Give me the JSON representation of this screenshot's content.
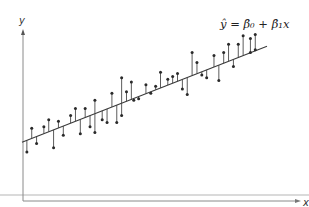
{
  "chart_data": {
    "type": "scatter",
    "title": "",
    "xlabel": "x",
    "ylabel": "y",
    "annotation": "ŷ = β̂₀ + β̂₁x",
    "grid": false,
    "legend": null,
    "xlim": [
      0,
      100
    ],
    "ylim": [
      0,
      100
    ],
    "regression_line": {
      "intercept": 22,
      "slope": 0.68,
      "x_start": 0,
      "x_end": 100
    },
    "points": [
      {
        "x": 2,
        "y": 15
      },
      {
        "x": 4,
        "y": 32
      },
      {
        "x": 6,
        "y": 21
      },
      {
        "x": 9,
        "y": 33
      },
      {
        "x": 11,
        "y": 38
      },
      {
        "x": 13,
        "y": 18
      },
      {
        "x": 15,
        "y": 37
      },
      {
        "x": 17,
        "y": 27
      },
      {
        "x": 20,
        "y": 41
      },
      {
        "x": 22,
        "y": 46
      },
      {
        "x": 24,
        "y": 28
      },
      {
        "x": 26,
        "y": 46
      },
      {
        "x": 28,
        "y": 33
      },
      {
        "x": 30,
        "y": 52
      },
      {
        "x": 30,
        "y": 29
      },
      {
        "x": 33,
        "y": 38
      },
      {
        "x": 35,
        "y": 36
      },
      {
        "x": 37,
        "y": 57
      },
      {
        "x": 39,
        "y": 36
      },
      {
        "x": 41,
        "y": 41
      },
      {
        "x": 41,
        "y": 68
      },
      {
        "x": 43,
        "y": 58
      },
      {
        "x": 45,
        "y": 65
      },
      {
        "x": 46,
        "y": 52
      },
      {
        "x": 48,
        "y": 53
      },
      {
        "x": 51,
        "y": 63
      },
      {
        "x": 53,
        "y": 57
      },
      {
        "x": 55,
        "y": 62
      },
      {
        "x": 57,
        "y": 72
      },
      {
        "x": 60,
        "y": 67
      },
      {
        "x": 62,
        "y": 69
      },
      {
        "x": 64,
        "y": 71
      },
      {
        "x": 66,
        "y": 60
      },
      {
        "x": 68,
        "y": 56
      },
      {
        "x": 70,
        "y": 86
      },
      {
        "x": 72,
        "y": 79
      },
      {
        "x": 74,
        "y": 70
      },
      {
        "x": 76,
        "y": 68
      },
      {
        "x": 79,
        "y": 84
      },
      {
        "x": 81,
        "y": 66
      },
      {
        "x": 83,
        "y": 86
      },
      {
        "x": 85,
        "y": 92
      },
      {
        "x": 87,
        "y": 76
      },
      {
        "x": 89,
        "y": 92
      },
      {
        "x": 91,
        "y": 98
      },
      {
        "x": 94,
        "y": 96
      },
      {
        "x": 94,
        "y": 86
      },
      {
        "x": 96,
        "y": 99
      },
      {
        "x": 96,
        "y": 88
      }
    ]
  },
  "labels": {
    "y_axis": "y",
    "x_axis": "x",
    "equation": "ŷ = β̂₀ + β̂₁x"
  },
  "colors": {
    "axis": "#8a8a8a",
    "line": "#3a3a3a",
    "points": "#2a2a2a",
    "residuals": "#4a4a4a"
  }
}
